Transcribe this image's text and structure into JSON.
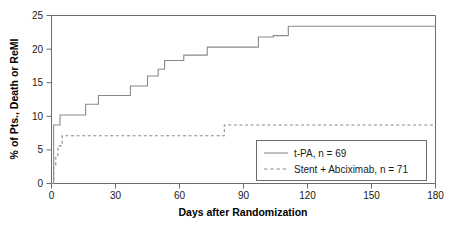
{
  "chart_data": {
    "type": "line",
    "title": "",
    "subtitle": "",
    "xlabel": "Days after Randomization",
    "ylabel": "% of Pts., Death or ReMI",
    "xlim": [
      0,
      180
    ],
    "ylim": [
      0,
      25
    ],
    "xticks": [
      0,
      30,
      60,
      90,
      120,
      150,
      180
    ],
    "xticklabels": [
      "0",
      "30",
      "60",
      "90",
      "120",
      "150",
      "180"
    ],
    "yticks": [
      0,
      5,
      10,
      15,
      20,
      25
    ],
    "yticklabels": [
      "0",
      "5",
      "10",
      "15",
      "20",
      "25"
    ],
    "grid": false,
    "legend_position": "lower right",
    "step_style": "post",
    "series": [
      {
        "name": "t-PA, n = 69",
        "style": "solid",
        "color": "#8a8a8a",
        "n": 69,
        "x": [
          0,
          1,
          4,
          16,
          22,
          37,
          45,
          50,
          53,
          62,
          73,
          97,
          104,
          111,
          180
        ],
        "y": [
          0,
          8.7,
          10.2,
          11.8,
          13.1,
          14.5,
          16.0,
          17.0,
          18.3,
          19.1,
          20.3,
          21.8,
          22.0,
          23.4,
          23.4
        ]
      },
      {
        "name": "Stent + Abciximab, n = 71",
        "style": "dashed",
        "color": "#8a8a8a",
        "n": 71,
        "x": [
          0,
          1,
          2,
          3,
          5,
          81,
          180
        ],
        "y": [
          0,
          2.8,
          4.2,
          5.6,
          7.1,
          8.7,
          8.7
        ]
      }
    ],
    "annotations": []
  },
  "legend": {
    "entries": [
      {
        "label": "t-PA, n = 69",
        "style": "solid"
      },
      {
        "label": "Stent + Abciximab, n = 71",
        "style": "dashed"
      }
    ]
  }
}
